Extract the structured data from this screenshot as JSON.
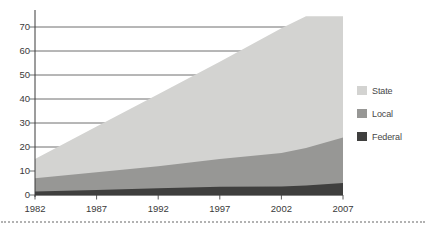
{
  "chart_data": {
    "type": "area",
    "stacked": true,
    "title": "",
    "xlabel": "",
    "ylabel": "",
    "x": [
      1982,
      1987,
      1992,
      1997,
      2002,
      2007
    ],
    "x_tick_labels": [
      "1982",
      "1987",
      "1992",
      "1997",
      "2002",
      "2007"
    ],
    "y_ticks": [
      0,
      10,
      20,
      30,
      40,
      50,
      60,
      70
    ],
    "ylim": [
      0,
      75
    ],
    "xlim": [
      1982,
      2007
    ],
    "grid": "horizontal",
    "legend_position": "right",
    "series": [
      {
        "name": "State",
        "color": "#d3d3d1",
        "values": [
          8.0,
          19.0,
          30.0,
          40.5,
          52.0,
          50.5
        ]
      },
      {
        "name": "Local",
        "color": "#979795",
        "values": [
          5.5,
          7.4,
          9.2,
          11.6,
          13.9,
          19.0
        ]
      },
      {
        "name": "Federal",
        "color": "#3f3f3e",
        "values": [
          1.5,
          2.1,
          2.8,
          3.4,
          3.6,
          5.0
        ]
      }
    ],
    "cumulative_tops": {
      "x": [
        1982,
        1987,
        1992,
        1997,
        2002,
        2004,
        2007
      ],
      "state": [
        15.0,
        28.5,
        42.0,
        55.5,
        69.5,
        74.5,
        74.5
      ],
      "local": [
        7.0,
        9.5,
        12.0,
        15.0,
        17.5,
        19.6,
        24.0
      ],
      "federal": [
        1.5,
        2.1,
        2.8,
        3.4,
        3.6,
        4.0,
        5.0
      ]
    }
  },
  "styles": {
    "grid_color": "#4a4a4a",
    "axis_color": "#3a3a3a",
    "text_color": "#3a3a3a",
    "dotted_rule_color": "#b2b2b2",
    "background": "#ffffff"
  }
}
